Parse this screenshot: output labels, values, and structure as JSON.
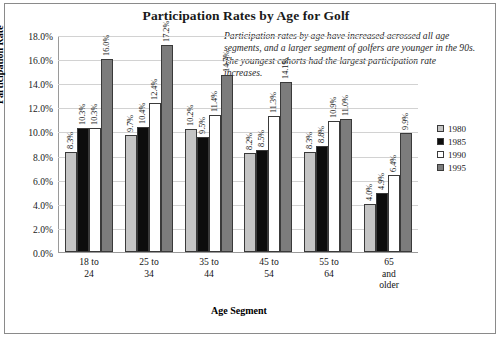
{
  "chart_data": {
    "type": "bar",
    "title": "Participation Rates by Age for Golf",
    "xlabel": "Age Segment",
    "ylabel": "Participation Rate",
    "ylim": [
      0,
      18
    ],
    "ytick_labels": [
      "0.0%",
      "2.0%",
      "4.0%",
      "6.0%",
      "8.0%",
      "10.0%",
      "12.0%",
      "14.0%",
      "16.0%",
      "18.0%"
    ],
    "ytick_values": [
      0,
      2,
      4,
      6,
      8,
      10,
      12,
      14,
      16,
      18
    ],
    "grid": true,
    "legend_position": "right",
    "annotation": "Participation rates by age have increased acrossed all age segments, and a larger segment of golfers are younger in the 90s. The youngest cohorts had the largest participation rate increases.",
    "categories": [
      "18 to 24",
      "25 to 34",
      "35 to 44",
      "45 to 54",
      "55 to 64",
      "65 and older"
    ],
    "category_lines": [
      [
        "18 to",
        "24"
      ],
      [
        "25 to",
        "34"
      ],
      [
        "35 to",
        "44"
      ],
      [
        "45 to",
        "54"
      ],
      [
        "55 to",
        "64"
      ],
      [
        "65",
        "and",
        "older"
      ]
    ],
    "series": [
      {
        "name": "1980",
        "color": "#c4c4c4",
        "values": [
          8.3,
          9.7,
          10.2,
          8.2,
          8.3,
          4.0
        ],
        "labels": [
          "8.3%",
          "9.7%",
          "10.2%",
          "8.2%",
          "8.3%",
          "4.0%"
        ]
      },
      {
        "name": "1985",
        "color": "#0d0d0d",
        "values": [
          10.3,
          10.4,
          9.5,
          8.5,
          8.8,
          4.9
        ],
        "labels": [
          "10.3%",
          "10.4%",
          "9.5%",
          "8.5%",
          "8.8%",
          "4.9%"
        ]
      },
      {
        "name": "1990",
        "color": "#ffffff",
        "values": [
          10.3,
          12.4,
          11.4,
          11.3,
          10.9,
          6.4
        ],
        "labels": [
          "10.3%",
          "12.4%",
          "11.4%",
          "11.3%",
          "10.9%",
          "6.4%"
        ]
      },
      {
        "name": "1995",
        "color": "#7c7c7c",
        "values": [
          16.0,
          17.2,
          14.7,
          14.1,
          11.0,
          9.9
        ],
        "labels": [
          "16.0%",
          "17.2%",
          "14.7%",
          "14.1%",
          "11.0%",
          "9.9%"
        ]
      }
    ]
  }
}
